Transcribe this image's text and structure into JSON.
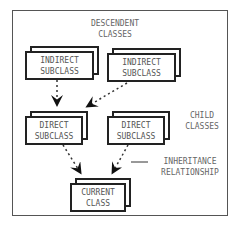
{
  "labels": {
    "descendent": "DESCENDENT\nCLASSES",
    "child": "CHILD\nCLASSES",
    "inheritance": "INHERITANCE\nRELATIONSHIP"
  },
  "nodes": {
    "indirect1": "INDIRECT\nSUBCLASS",
    "indirect2": "INDIRECT\nSUBCLASS",
    "direct1": "DIRECT\nSUBCLASS",
    "direct2": "DIRECT\nSUBCLASS",
    "current": "CURRENT\nCLASS"
  }
}
